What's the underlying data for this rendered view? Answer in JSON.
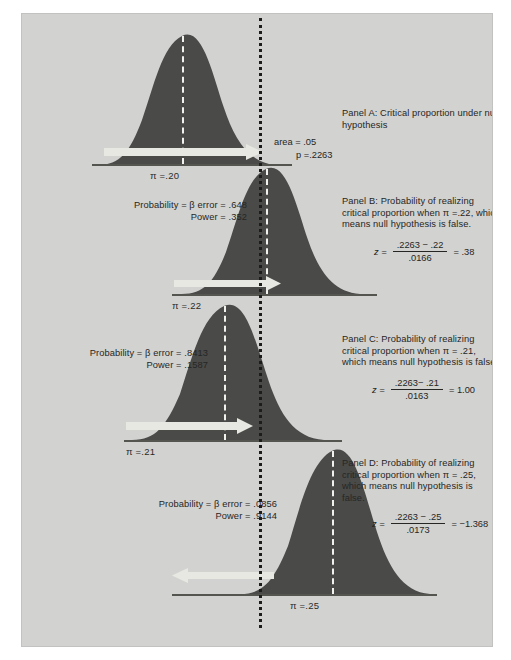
{
  "figure": {
    "background_color": "#d2d2d0",
    "curve_fill_color": "#4a4a48",
    "arrow_color": "#e8e8e2",
    "critical_line_color": "#1c1c1c",
    "mean_line_color": "#f2f2ee"
  },
  "critical_value": ".2263",
  "panels": [
    {
      "id": "panel-a",
      "label": "Panel A: Critical proportion under null hypothesis",
      "pi_label": "π =.20",
      "pi_value": 0.2,
      "area_label": "area = .05",
      "p_label": "p =.2263",
      "arrow_direction": "right"
    },
    {
      "id": "panel-b",
      "label": "Panel B: Probability of realizing critical proportion when π =.22, which means null hypothesis is false.",
      "pi_label": "π =.22",
      "pi_value": 0.22,
      "beta_line": "Probability = β error = .648",
      "power_line": "Power = .352",
      "beta_error": ".648",
      "power": ".352",
      "z_numerator": ".2263 − .22",
      "z_denominator": ".0166",
      "z_result": "= .38",
      "z_symbol": "z =",
      "arrow_direction": "right"
    },
    {
      "id": "panel-c",
      "label": "Panel C: Probability of realizing critical proportion when π = .21, which means null hypothesis is false.",
      "pi_label": "π =.21",
      "pi_value": 0.21,
      "beta_line": "Probability = β error = .8413",
      "power_line": "Power = .1587",
      "beta_error": ".8413",
      "power": ".1587",
      "z_numerator": ".2263− .21",
      "z_denominator": ".0163",
      "z_result": "= 1.00",
      "z_symbol": "z =",
      "arrow_direction": "right"
    },
    {
      "id": "panel-d",
      "label": "Panel D: Probability of realizing critical proportion when π = .25, which means null hypothesis is false.",
      "pi_label": "π =.25",
      "pi_value": 0.25,
      "beta_line": "Probability = β error = .0856",
      "power_line": "Power = .9144",
      "beta_error": ".0856",
      "power": ".9144",
      "z_numerator": ".2263 − .25",
      "z_denominator": ".0173",
      "z_result": "= −1.368",
      "z_symbol": "z =",
      "arrow_direction": "left"
    }
  ]
}
